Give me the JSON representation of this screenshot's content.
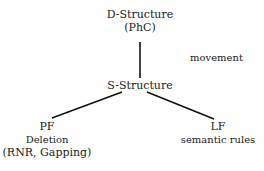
{
  "diagram": {
    "nodes": {
      "dstructure": {
        "title": "D-Structure",
        "subtitle": "(PhC)"
      },
      "sstructure": {
        "title": "S-Structure"
      },
      "pf": {
        "title": "PF",
        "line2": "Deletion",
        "line3": "(RNR, Gapping)"
      },
      "lf": {
        "title": "LF",
        "line2": "semantic rules"
      }
    },
    "edge_labels": {
      "movement": "movement"
    },
    "edges": [
      {
        "from": "D-Structure",
        "to": "S-Structure",
        "label": "movement"
      },
      {
        "from": "S-Structure",
        "to": "PF"
      },
      {
        "from": "S-Structure",
        "to": "LF"
      }
    ]
  }
}
